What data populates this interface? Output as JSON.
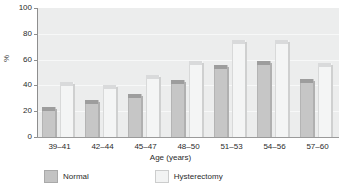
{
  "chart_data": {
    "type": "bar",
    "title": "",
    "xlabel": "Age (years)",
    "ylabel": "%",
    "ylim": [
      0,
      100
    ],
    "yticks": [
      0,
      20,
      40,
      60,
      80,
      100
    ],
    "grid": true,
    "legend_position": "bottom",
    "categories": [
      "39–41",
      "42–44",
      "45–47",
      "48–50",
      "51–53",
      "54–56",
      "57–60"
    ],
    "series": [
      {
        "name": "Normal",
        "color": "#c6c6c6",
        "values": [
          23,
          29,
          33,
          44,
          56,
          59,
          45
        ]
      },
      {
        "name": "Hysterectomy",
        "color": "#f4f5f5",
        "values": [
          43,
          40,
          48,
          59,
          75,
          75,
          57
        ]
      }
    ]
  },
  "axis": {
    "y_label": "%",
    "y_ticks": [
      "100",
      "80",
      "60",
      "40",
      "20",
      "0"
    ],
    "x_label": "Age (years)",
    "x_ticks": [
      "39–41",
      "42–44",
      "45–47",
      "48–50",
      "51–53",
      "54–56",
      "57–60"
    ]
  },
  "legend": {
    "items": [
      {
        "label": "Normal"
      },
      {
        "label": "Hysterectomy"
      }
    ]
  },
  "colors": {
    "plot_background": "#eceded",
    "normal_bar": "#c6c6c6",
    "hysterectomy_bar": "#f4f5f5",
    "axis": "#8e8e8e"
  }
}
